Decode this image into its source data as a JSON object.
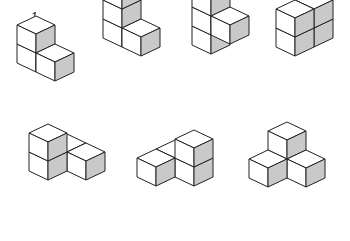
{
  "colors": {
    "background": "#ffffff",
    "top_face": "#ffffff",
    "front_face": "#ffffff",
    "side_face": "#c9c9c9",
    "stroke": "#222222"
  },
  "geometry": {
    "half_width": 19,
    "depth_rise": 9,
    "cube_height": 19
  },
  "figures": [
    {
      "label": "1",
      "label_pos": [
        34,
        21
      ],
      "origin": [
        36,
        54
      ],
      "cubes": [
        [
          0,
          0,
          0
        ],
        [
          0,
          0,
          1
        ],
        [
          1,
          0,
          0
        ]
      ]
    },
    {
      "label": "2",
      "label_pos": [
        124,
        21
      ],
      "origin": [
        122,
        29
      ],
      "cubes": [
        [
          0,
          0,
          0
        ],
        [
          0,
          0,
          1
        ],
        [
          0,
          0,
          2
        ],
        [
          1,
          0,
          0
        ]
      ]
    },
    {
      "label": "3",
      "label_pos": [
        211,
        21
      ],
      "origin": [
        211,
        36
      ],
      "cubes": [
        [
          0,
          0,
          0
        ],
        [
          0,
          0,
          1
        ],
        [
          0,
          0,
          2
        ],
        [
          1,
          0,
          1
        ]
      ]
    },
    {
      "label": "4",
      "label_pos": [
        313,
        21
      ],
      "origin": [
        314,
        29
      ],
      "cubes": [
        [
          0,
          0,
          0
        ],
        [
          0,
          0,
          1
        ],
        [
          0,
          1,
          0
        ],
        [
          0,
          1,
          1
        ]
      ]
    },
    {
      "label": "5",
      "label_pos": [
        48,
        152
      ],
      "origin": [
        48,
        162
      ],
      "cubes": [
        [
          0,
          -1,
          0
        ],
        [
          1,
          -1,
          0
        ],
        [
          0,
          0,
          0
        ],
        [
          0,
          0,
          1
        ]
      ]
    },
    {
      "label": "6",
      "label_pos": [
        195,
        152
      ],
      "origin": [
        194,
        168
      ],
      "cubes": [
        [
          -1,
          0,
          0
        ],
        [
          0,
          0,
          0
        ],
        [
          0,
          0,
          1
        ],
        [
          -1,
          1,
          0
        ]
      ]
    },
    {
      "label": "7",
      "label_pos": [
        287,
        152
      ],
      "origin": [
        287,
        160
      ],
      "cubes": [
        [
          0,
          0,
          0
        ],
        [
          0,
          0,
          1
        ],
        [
          1,
          0,
          0
        ],
        [
          0,
          1,
          0
        ]
      ]
    }
  ]
}
